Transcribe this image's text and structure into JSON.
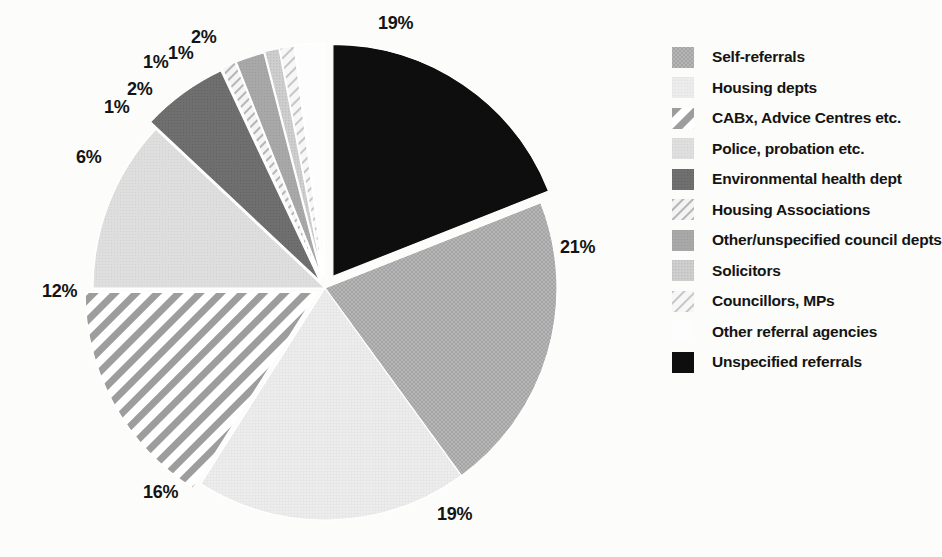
{
  "chart_data": {
    "type": "pie",
    "title": "",
    "subtitle": "",
    "xlabel": "",
    "ylabel": "",
    "legend_position": "right",
    "grid": false,
    "exploded": true,
    "units": "percent",
    "categories": [
      "Self-referrals",
      "Housing depts",
      "CABx, Advice Centres etc.",
      "Police, probation etc.",
      "Environmental health dept",
      "Housing Associations",
      "Other/unspecified council depts",
      "Solicitors",
      "Councillors, MPs",
      "Other referral agencies",
      "Unspecified referrals"
    ],
    "values": [
      21,
      19,
      16,
      12,
      6,
      1,
      2,
      1,
      1,
      2,
      19
    ],
    "value_labels": [
      "21%",
      "19%",
      "16%",
      "12%",
      "6%",
      "1%",
      "2%",
      "1%",
      "1%",
      "2%",
      "19%"
    ],
    "colors": [
      "#b2b2b2",
      "#ebebeb",
      "#9a9a9a",
      "#dcdcdc",
      "#6d6d6d",
      "#cfcfcf",
      "#a6a6a6",
      "#c9c9c9",
      "#dcdcdc",
      "#fbfbfb",
      "#0c0c0c"
    ],
    "patterns": [
      "crosshatch",
      "fine-grid",
      "diagonal-stripes",
      "solid-light",
      "solid-dark",
      "sparse-diagonal",
      "solid-mid",
      "fine-dots",
      "sparse-hatch",
      "blank",
      "solid-black"
    ]
  },
  "slices": [
    {
      "id": "unspecified-referrals",
      "label": "Unspecified referrals",
      "value": 19,
      "value_label": "19%",
      "start": 0,
      "end": 68.4,
      "color": "#0c0c0c",
      "pattern": "solid-black",
      "explode": 14,
      "label_x": 378,
      "label_y": 14
    },
    {
      "id": "self-referrals",
      "label": "Self-referrals",
      "value": 21,
      "value_label": "21%",
      "start": 68.4,
      "end": 144.0,
      "color": "#b2b2b2",
      "pattern": "crosshatch",
      "explode": 0,
      "label_x": 560,
      "label_y": 238
    },
    {
      "id": "housing-depts",
      "label": "Housing depts",
      "value": 19,
      "value_label": "19%",
      "start": 144.0,
      "end": 212.4,
      "color": "#ebebeb",
      "pattern": "fine-grid",
      "explode": 0,
      "label_x": 437,
      "label_y": 505
    },
    {
      "id": "cabx-advice-centres",
      "label": "CABx, Advice Centres etc.",
      "value": 16,
      "value_label": "16%",
      "start": 212.4,
      "end": 270.0,
      "color": "#9a9a9a",
      "pattern": "diagonal-stripes",
      "explode": 9,
      "label_x": 143,
      "label_y": 483
    },
    {
      "id": "police-probation",
      "label": "Police, probation etc.",
      "value": 12,
      "value_label": "12%",
      "start": 270.0,
      "end": 313.2,
      "color": "#dcdcdc",
      "pattern": "solid-light",
      "explode": 0,
      "label_x": 42,
      "label_y": 282
    },
    {
      "id": "environmental-health",
      "label": "Environmental health dept",
      "value": 6,
      "value_label": "6%",
      "start": 313.2,
      "end": 334.8,
      "color": "#6d6d6d",
      "pattern": "solid-dark",
      "explode": 9,
      "label_x": 76,
      "label_y": 148
    },
    {
      "id": "housing-associations",
      "label": "Housing Associations",
      "value": 1,
      "value_label": "1%",
      "start": 334.8,
      "end": 338.4,
      "color": "#cfcfcf",
      "pattern": "sparse-diagonal",
      "explode": 11,
      "label_x": 104,
      "label_y": 98
    },
    {
      "id": "other-council-depts",
      "label": "Other/unspecified council depts",
      "value": 2,
      "value_label": "2%",
      "start": 338.4,
      "end": 345.6,
      "color": "#a6a6a6",
      "pattern": "solid-mid",
      "explode": 11,
      "label_x": 127,
      "label_y": 80
    },
    {
      "id": "solicitors",
      "label": "Solicitors",
      "value": 1,
      "value_label": "1%",
      "start": 345.6,
      "end": 349.2,
      "color": "#c9c9c9",
      "pattern": "fine-dots",
      "explode": 12,
      "label_x": 143,
      "label_y": 53
    },
    {
      "id": "councillors-mps",
      "label": "Councillors, MPs",
      "value": 1,
      "value_label": "1%",
      "start": 349.2,
      "end": 352.8,
      "color": "#dcdcdc",
      "pattern": "sparse-hatch",
      "explode": 12,
      "label_x": 168,
      "label_y": 44
    },
    {
      "id": "other-referral-agencies",
      "label": "Other referral agencies",
      "value": 2,
      "value_label": "2%",
      "start": 352.8,
      "end": 360.0,
      "color": "#fbfbfb",
      "pattern": "blank",
      "explode": 13,
      "label_x": 191,
      "label_y": 28
    }
  ],
  "legend": {
    "items": [
      {
        "label": "Self-referrals",
        "pattern": "crosshatch",
        "color": "#b2b2b2"
      },
      {
        "label": "Housing depts",
        "pattern": "fine-grid",
        "color": "#ebebeb"
      },
      {
        "label": "CABx, Advice Centres etc.",
        "pattern": "diagonal-stripes",
        "color": "#9a9a9a"
      },
      {
        "label": "Police, probation etc.",
        "pattern": "solid-light",
        "color": "#dcdcdc"
      },
      {
        "label": "Environmental health dept",
        "pattern": "solid-dark",
        "color": "#6d6d6d"
      },
      {
        "label": "Housing Associations",
        "pattern": "sparse-diagonal",
        "color": "#cfcfcf"
      },
      {
        "label": "Other/unspecified council depts",
        "pattern": "solid-mid",
        "color": "#a6a6a6"
      },
      {
        "label": "Solicitors",
        "pattern": "fine-dots",
        "color": "#c9c9c9"
      },
      {
        "label": "Councillors, MPs",
        "pattern": "sparse-hatch",
        "color": "#dcdcdc"
      },
      {
        "label": "Other referral agencies",
        "pattern": "blank",
        "color": "#ffffff"
      },
      {
        "label": "Unspecified referrals",
        "pattern": "solid-black",
        "color": "#0c0c0c"
      }
    ]
  }
}
